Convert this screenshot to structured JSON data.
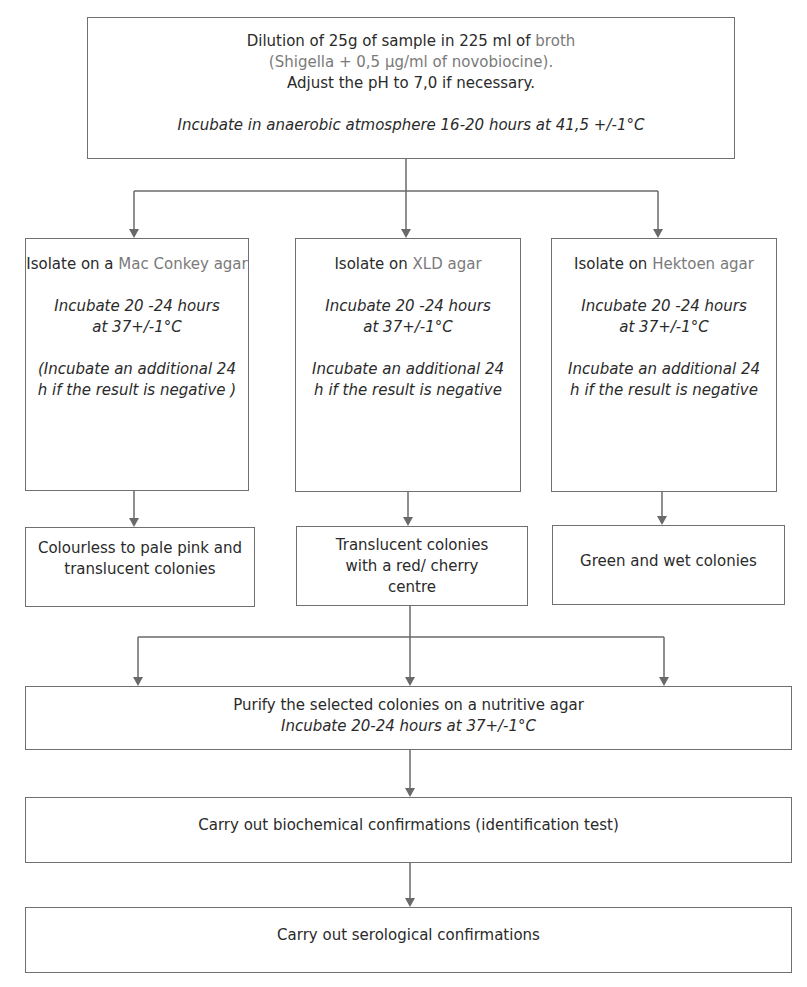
{
  "colors": {
    "line": "#6a6a6a",
    "highlight_text": "#7a7a7a",
    "text": "#2a2a2a"
  },
  "top_step": {
    "line1_prefix": "Dilution of 25g of sample in 225 ml of ",
    "line1_highlight": "broth",
    "line2_highlight": "(Shigella + 0,5 µg/ml of novobiocine).",
    "line3": "Adjust the pH to 7,0 if necessary.",
    "incubation": "Incubate in anaerobic atmosphere 16-20 hours at 41,5 +/-1°C"
  },
  "isolation_steps": [
    {
      "prefix": "Isolate on a ",
      "medium": "Mac Conkey agar",
      "incubation_line1": "Incubate 20 -24 hours",
      "incubation_line2": "at 37+/-1°C",
      "note": "(Incubate an additional 24 h if the result is negative )"
    },
    {
      "prefix": "Isolate on ",
      "medium": "XLD agar",
      "incubation_line1": "Incubate 20 -24 hours",
      "incubation_line2": "at 37+/-1°C",
      "note": "Incubate an additional 24 h if the result is negative"
    },
    {
      "prefix": "Isolate on ",
      "medium": "Hektoen agar",
      "incubation_line1": "Incubate 20 -24 hours",
      "incubation_line2": "at 37+/-1°C",
      "note": "Incubate an additional 24 h if the result is negative"
    }
  ],
  "results": [
    "Colourless to pale pink and translucent colonies",
    "Translucent colonies with a red/ cherry centre",
    "Green and wet colonies"
  ],
  "purify_step": {
    "line1": "Purify the selected colonies on a nutritive agar",
    "line2": "Incubate 20-24 hours at 37+/-1°C"
  },
  "biochem_step": "Carry out biochemical confirmations (identification test)",
  "serology_step": "Carry out serological confirmations"
}
